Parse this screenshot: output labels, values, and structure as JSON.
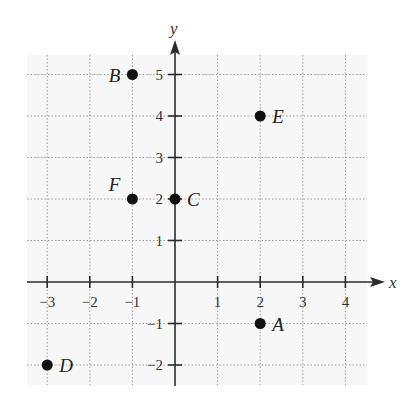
{
  "chart_data": {
    "type": "scatter",
    "title": "",
    "xlabel": "x",
    "ylabel": "y",
    "xlim": [
      -3.5,
      4.5
    ],
    "ylim": [
      -2.5,
      5.5
    ],
    "grid": true,
    "x_ticks": [
      -3,
      -2,
      -1,
      1,
      2,
      3,
      4
    ],
    "y_ticks": [
      -2,
      -1,
      1,
      2,
      3,
      4,
      5
    ],
    "x_tick_labels": [
      "−3",
      "−2",
      "−1",
      "1",
      "2",
      "3",
      "4"
    ],
    "y_tick_labels": [
      "−2",
      "−1",
      "1",
      "2",
      "3",
      "4",
      "5"
    ],
    "points": [
      {
        "label": "A",
        "x": 2,
        "y": -1
      },
      {
        "label": "B",
        "x": -1,
        "y": 5
      },
      {
        "label": "C",
        "x": 0,
        "y": 2
      },
      {
        "label": "D",
        "x": -3,
        "y": -2
      },
      {
        "label": "E",
        "x": 2,
        "y": 4
      },
      {
        "label": "F",
        "x": -1,
        "y": 2
      }
    ]
  },
  "axes": {
    "x_label": "x",
    "y_label": "y"
  },
  "colors": {
    "axis": "#2b2b2b",
    "grid": "#9a9a9a",
    "point": "#111111",
    "grid_background": "#f7f7f7"
  }
}
